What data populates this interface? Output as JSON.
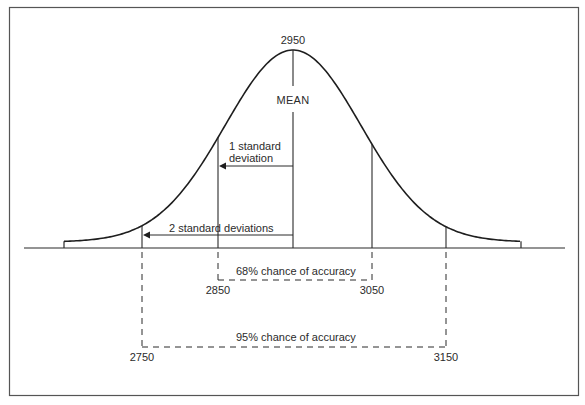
{
  "figure": {
    "type": "normal distribution diagram",
    "mean_value": "2950",
    "mean_label": "MEAN",
    "sd1_label_line1": "1 standard",
    "sd1_label_line2": "deviation",
    "sd2_label": "2 standard deviations",
    "range_68": {
      "label": "68% chance of accuracy",
      "low": "2850",
      "high": "3050"
    },
    "range_95": {
      "label": "95% chance of accuracy",
      "low": "2750",
      "high": "3150"
    },
    "colors": {
      "line": "#2a2a2a",
      "frame": "#555555",
      "background": "#ffffff"
    }
  },
  "geometry": {
    "frame": {
      "x": 9,
      "y": 7,
      "w": 569,
      "h": 388
    },
    "baseline": {
      "y": 248,
      "x1": 24,
      "x2": 565
    },
    "curve": {
      "mean_x": 293,
      "peak_y": 50,
      "sigma_px": 68,
      "x_start": 64,
      "x_end": 521,
      "tail_offset": 6
    },
    "mean_line_x": 293,
    "sd1_left_x": 218,
    "sd1_right_x": 372,
    "sd2_left_x": 142,
    "sd2_right_x": 446
  }
}
